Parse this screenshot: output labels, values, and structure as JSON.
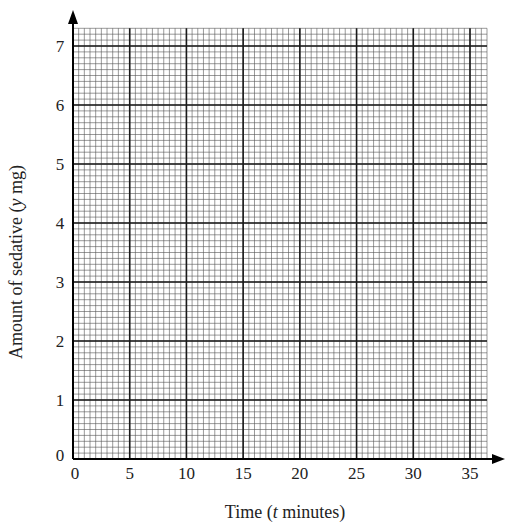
{
  "chart_data": {
    "type": "line",
    "title": "",
    "xlabel": "Time (t minutes)",
    "xlabel_parts": [
      "Time (",
      "t",
      " minutes)"
    ],
    "ylabel": "Amount of sedative (y mg)",
    "ylabel_parts": [
      "Amount of sedative (",
      "y",
      " mg)"
    ],
    "xlim": [
      0,
      36.5
    ],
    "ylim": [
      0,
      7.3
    ],
    "x_ticks": [
      0,
      5,
      10,
      15,
      20,
      25,
      30,
      35
    ],
    "y_ticks": [
      0,
      1,
      2,
      3,
      4,
      5,
      6,
      7
    ],
    "x_tick_labels": [
      "0",
      "5",
      "10",
      "15",
      "20",
      "25",
      "30",
      "35"
    ],
    "y_tick_labels": [
      "0",
      "1",
      "2",
      "3",
      "4",
      "5",
      "6",
      "7"
    ],
    "grid": {
      "on": true,
      "style": "graph paper",
      "major_x_every": 5,
      "minor_x_every": 0.5,
      "major_y_every": 1,
      "minor_y_every": 0.1
    },
    "series": [],
    "legend": null,
    "axes_arrows": true
  },
  "colors": {
    "major_grid": "#1a1a1a",
    "minor_grid": "#555555",
    "axis": "#000000",
    "text": "#222222"
  }
}
